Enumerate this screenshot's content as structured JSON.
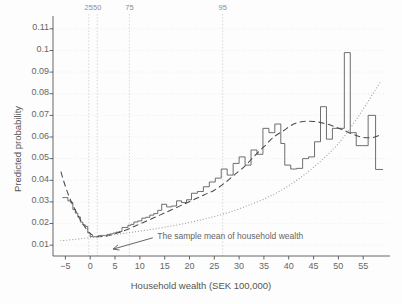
{
  "chart_data": {
    "type": "line",
    "title": "",
    "xlabel": "Household wealth (SEK 100,000)",
    "ylabel": "Predicted probability",
    "xlim": [
      -7.5,
      60
    ],
    "ylim": [
      0.005,
      0.115
    ],
    "grid": true,
    "legend_position": "none",
    "yticks": [
      0.01,
      0.02,
      0.03,
      0.04,
      0.05,
      0.06,
      0.07,
      0.08,
      0.09,
      0.1,
      0.11
    ],
    "ytick_labels": [
      "0.01",
      "0.02",
      "0.03",
      "0.04",
      "0.05",
      "0.06",
      "0.07",
      "0.08",
      "0.09",
      "0.1",
      "0.11"
    ],
    "xticks": [
      -5,
      0,
      5,
      10,
      15,
      20,
      25,
      30,
      35,
      40,
      45,
      50,
      55
    ],
    "xtick_labels": [
      "-5",
      "0",
      "5",
      "10",
      "15",
      "20",
      "25",
      "30",
      "35",
      "40",
      "45",
      "50",
      "55"
    ],
    "percentile_markers": [
      {
        "label": "25",
        "x": -0.3
      },
      {
        "label": "50",
        "x": 1.4
      },
      {
        "label": "75",
        "x": 7.9
      },
      {
        "label": "95",
        "x": 26.7
      }
    ],
    "annotations": [
      {
        "text": "The sample mean of household wealth",
        "text_x": 13.5,
        "text_y": 0.0139,
        "arrow_from_x": 12.6,
        "arrow_from_y": 0.0134,
        "arrow_to_x": 4.6,
        "arrow_to_y": 0.0082
      }
    ],
    "series": [
      {
        "name": "step-estimate",
        "style": "step",
        "linestyle": "solid",
        "color": "#555555",
        "x": [
          -5.6,
          -5.0,
          -4.5,
          -4.0,
          -3.5,
          -3.0,
          -2.5,
          -2.0,
          -1.5,
          -1.0,
          -0.5,
          0.0,
          0.5,
          1.0,
          1.6,
          2.2,
          2.8,
          3.4,
          4.0,
          4.6,
          5.2,
          5.8,
          6.4,
          7.0,
          7.6,
          8.2,
          8.8,
          9.6,
          10.4,
          11.2,
          12.0,
          12.8,
          13.6,
          14.4,
          15.4,
          16.4,
          17.4,
          18.4,
          19.4,
          20.4,
          21.6,
          22.8,
          24.0,
          25.2,
          26.4,
          27.6,
          28.8,
          30.0,
          31.2,
          32.4,
          33.6,
          34.8,
          36.0,
          37.2,
          38.4,
          39.2,
          40.4,
          41.6,
          42.8,
          44.0,
          45.2,
          46.4,
          47.6,
          48.8,
          50.0,
          51.2,
          52.4,
          53.6,
          54.8,
          56.0,
          57.5
        ],
        "y": [
          0.032,
          0.032,
          0.0305,
          0.0298,
          0.0265,
          0.0248,
          0.0231,
          0.0207,
          0.0194,
          0.0187,
          0.0157,
          0.014,
          0.0139,
          0.0139,
          0.0144,
          0.0145,
          0.0145,
          0.015,
          0.0152,
          0.0156,
          0.016,
          0.0163,
          0.0182,
          0.0182,
          0.0192,
          0.0196,
          0.0207,
          0.0212,
          0.0225,
          0.0229,
          0.0239,
          0.0246,
          0.0261,
          0.0289,
          0.0277,
          0.0281,
          0.0305,
          0.0297,
          0.031,
          0.034,
          0.0348,
          0.037,
          0.0392,
          0.041,
          0.0452,
          0.0424,
          0.0478,
          0.0508,
          0.047,
          0.054,
          0.052,
          0.064,
          0.062,
          0.066,
          0.057,
          0.047,
          0.0452,
          0.0455,
          0.05,
          0.0508,
          0.0578,
          0.074,
          0.059,
          0.064,
          0.064,
          0.099,
          0.062,
          0.056,
          0.056,
          0.07,
          0.045
        ],
        "note": "non-parametric step estimate"
      },
      {
        "name": "smooth-fit",
        "style": "smooth",
        "linestyle": "dashed",
        "color": "#4a4a4a",
        "x": [
          -5.9,
          -5.4,
          -4.9,
          -4.4,
          -3.9,
          -3.4,
          -2.9,
          -2.4,
          -1.9,
          -1.4,
          -0.9,
          -0.4,
          0.1,
          0.6,
          1.1,
          1.6,
          2.6,
          3.6,
          4.6,
          5.6,
          6.6,
          8.0,
          9.4,
          10.8,
          12.2,
          13.6,
          15.0,
          17.0,
          19.0,
          21.0,
          23.0,
          25.0,
          27.0,
          29.0,
          31.0,
          33.0,
          35.0,
          37.0,
          39.0,
          41.0,
          43.0,
          45.0,
          47.0,
          49.0,
          51.0,
          53.0,
          55.0,
          57.0,
          58.5
        ],
        "y": [
          0.044,
          0.04,
          0.0365,
          0.0333,
          0.0305,
          0.028,
          0.0257,
          0.0235,
          0.0214,
          0.0196,
          0.0178,
          0.0163,
          0.0152,
          0.0145,
          0.0141,
          0.0139,
          0.014,
          0.0144,
          0.015,
          0.0157,
          0.0165,
          0.0178,
          0.0192,
          0.0206,
          0.022,
          0.0235,
          0.0249,
          0.027,
          0.0291,
          0.0312,
          0.0333,
          0.0354,
          0.0386,
          0.0424,
          0.0462,
          0.051,
          0.0555,
          0.06,
          0.063,
          0.066,
          0.0672,
          0.0672,
          0.0664,
          0.065,
          0.0632,
          0.0612,
          0.0598,
          0.0598,
          0.061
        ],
        "note": "flexible (dashed) fitted curve"
      },
      {
        "name": "linear-fit",
        "style": "smooth",
        "linestyle": "dotted",
        "color": "#9b9b9b",
        "x": [
          -6.0,
          0.0,
          10.0,
          20.0,
          30.0,
          40.0,
          50.0,
          58.5
        ],
        "y": [
          0.012,
          0.0135,
          0.0165,
          0.0205,
          0.0268,
          0.0375,
          0.057,
          0.0855
        ],
        "note": "monotone (dotted) parametric fit"
      }
    ]
  }
}
